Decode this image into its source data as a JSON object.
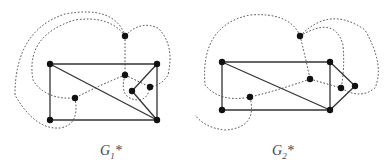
{
  "figures": [
    {
      "id": "G1*",
      "label_main": "G",
      "label_sub": "1",
      "label_suffix": "*"
    },
    {
      "id": "G2*",
      "label_main": "G",
      "label_sub": "2",
      "label_suffix": "*"
    }
  ],
  "colors": {
    "edge": "#333333",
    "dual_edge": "#444444",
    "vertex": "#111111"
  }
}
